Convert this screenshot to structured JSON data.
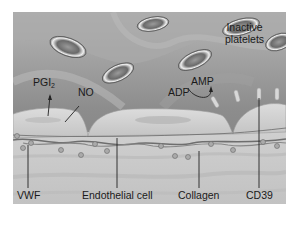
{
  "figure": {
    "labels": {
      "inactive_platelets_line1": "Inactive",
      "inactive_platelets_line2": "platelets",
      "pgi2_main": "PGI",
      "pgi2_sub": "2",
      "no": "NO",
      "adp": "ADP",
      "amp": "AMP",
      "vwf": "VWF",
      "endothelial_cell": "Endothelial cell",
      "collagen": "Collagen",
      "cd39": "CD39"
    },
    "colors": {
      "lumen": "#8f8f8f",
      "platelet": "#7d7d7d",
      "endothelium": "#d2d2d2",
      "subendothelium": "#c8c8c8",
      "leader_line": "#222222"
    }
  }
}
